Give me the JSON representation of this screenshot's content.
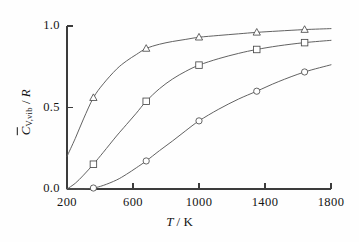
{
  "chart_data": {
    "type": "line",
    "title": "",
    "subtitle": "",
    "xlabel": "T / K",
    "ylabel": "C̄V,vib / R",
    "xlabel_parts": {
      "symbol": "T",
      "separator": " / ",
      "unit": "K"
    },
    "ylabel_parts": {
      "symbol": "C",
      "subscript": "V,vib",
      "separator": " / ",
      "unit": "R",
      "overbar": true
    },
    "xlim": [
      200,
      1800
    ],
    "ylim": [
      0.0,
      1.0
    ],
    "xticks": [
      200,
      600,
      1000,
      1400,
      1800
    ],
    "xtick_labels": [
      "200",
      "600",
      "1000",
      "1400",
      "1800"
    ],
    "yticks": [
      0.0,
      0.5,
      1.0
    ],
    "ytick_labels": [
      "0.0",
      "0.5",
      "1.0"
    ],
    "grid": false,
    "legend": "none",
    "axes_style": "left-bottom-spines",
    "line_color": "#5a5a5a",
    "marker_facecolor": "#ffffff",
    "marker_edgecolor": "#4a4a4a",
    "background_color": "#fefefe",
    "series": [
      {
        "name": "upper-curve",
        "marker": "triangle",
        "x": [
          200,
          250,
          300,
          360,
          420,
          500,
          560,
          620,
          680,
          760,
          840,
          920,
          1000,
          1120,
          1240,
          1350,
          1480,
          1640,
          1800
        ],
        "values": [
          0.2,
          0.31,
          0.43,
          0.56,
          0.645,
          0.735,
          0.785,
          0.825,
          0.862,
          0.888,
          0.905,
          0.918,
          0.931,
          0.942,
          0.952,
          0.961,
          0.969,
          0.978,
          0.984
        ],
        "marker_x": [
          360,
          680,
          1000,
          1350,
          1640
        ],
        "marker_y": [
          0.56,
          0.862,
          0.931,
          0.961,
          0.978
        ]
      },
      {
        "name": "middle-curve",
        "marker": "square",
        "x": [
          200,
          250,
          300,
          360,
          420,
          500,
          560,
          620,
          680,
          760,
          840,
          920,
          1000,
          1120,
          1240,
          1350,
          1480,
          1640,
          1800
        ],
        "values": [
          0.0,
          0.035,
          0.085,
          0.152,
          0.225,
          0.325,
          0.395,
          0.465,
          0.538,
          0.615,
          0.675,
          0.722,
          0.76,
          0.8,
          0.832,
          0.856,
          0.878,
          0.898,
          0.912
        ],
        "marker_x": [
          360,
          680,
          1000,
          1350,
          1640
        ],
        "marker_y": [
          0.152,
          0.538,
          0.76,
          0.856,
          0.898
        ]
      },
      {
        "name": "lower-curve",
        "marker": "circle",
        "x": [
          200,
          250,
          300,
          360,
          420,
          500,
          560,
          620,
          680,
          760,
          840,
          920,
          1000,
          1120,
          1240,
          1350,
          1480,
          1640,
          1800
        ],
        "values": [
          0.0,
          0.0,
          0.0,
          0.006,
          0.022,
          0.055,
          0.09,
          0.13,
          0.172,
          0.235,
          0.295,
          0.358,
          0.418,
          0.49,
          0.552,
          0.6,
          0.658,
          0.718,
          0.762
        ],
        "marker_x": [
          360,
          680,
          1000,
          1350,
          1640
        ],
        "marker_y": [
          0.006,
          0.172,
          0.418,
          0.6,
          0.718
        ]
      }
    ],
    "geometry": {
      "left_px": 67,
      "right_px": 331,
      "top_px": 26,
      "bottom_px": 189,
      "tick_len_px": 6,
      "marker_size_px": 6.5
    }
  }
}
